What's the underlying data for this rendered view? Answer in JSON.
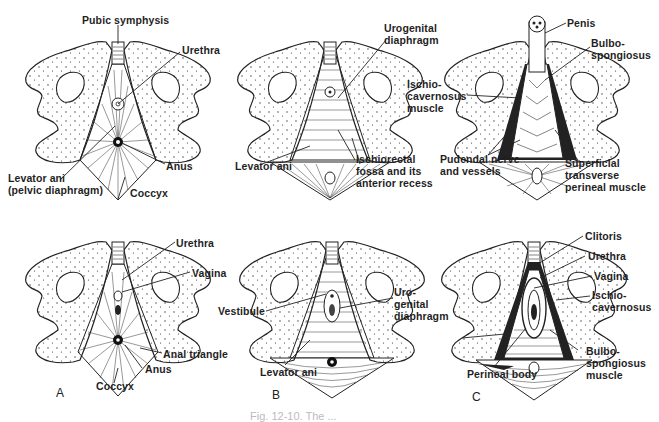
{
  "figure": {
    "caption": "Fig. 12-10. The ...",
    "panels": [
      {
        "id": "A",
        "label": "A"
      },
      {
        "id": "B",
        "label": "B"
      },
      {
        "id": "C",
        "label": "C"
      }
    ]
  },
  "male": {
    "A": {
      "pubic_symphysis": "Pubic symphysis",
      "urethra": "Urethra",
      "levator_ani": "Levator ani\n(pelvic diaphragm)",
      "anus": "Anus",
      "coccyx": "Coccyx"
    },
    "B": {
      "urogenital_diaphragm": "Urogenital\ndiaphragm",
      "levator_ani": "Levator ani",
      "ischiorectal_fossa": "Ischiorectal\nfossa and its\nanterior recess"
    },
    "C": {
      "penis": "Penis",
      "bulbospongiosus": "Bulbo-\nspongiosus",
      "ischiocavernosus": "Ischio-\ncavernosus\nmuscle",
      "pudendal": "Pudendal nerve\nand vessels",
      "superficial_transverse": "Superficial\ntransverse\nperineal muscle"
    }
  },
  "female": {
    "A": {
      "urethra": "Urethra",
      "vagina": "Vagina",
      "anal_triangle": "Anal triangle",
      "anus": "Anus",
      "coccyx": "Coccyx"
    },
    "B": {
      "vestibule": "Vestibule",
      "urogenital_diaphragm": "Uro-\ngenital\ndiaphragm",
      "levator_ani": "Levator ani"
    },
    "C": {
      "clitoris": "Clitoris",
      "urethra": "Urethra",
      "vagina": "Vagina",
      "ischiocavernosus": "Ischio-\ncavernosus",
      "bulbospongiosus": "Bulbo-\nspongiosus\nmuscle",
      "perineal_body": "Perineal body"
    }
  }
}
